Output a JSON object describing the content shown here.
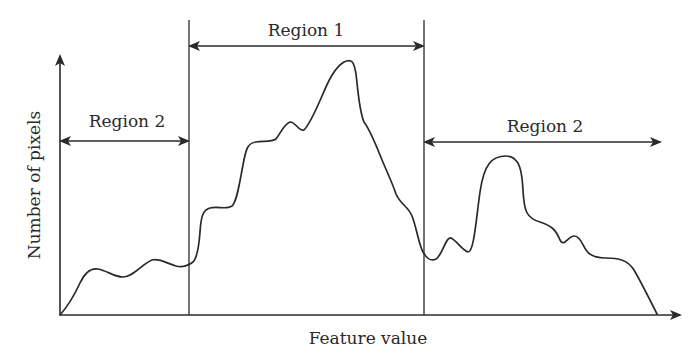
{
  "figure": {
    "type": "histogram-diagram",
    "x_axis_label": "Feature value",
    "y_axis_label": "Number of pixels",
    "regions": [
      {
        "id": "left",
        "label": "Region 2",
        "x_start": 60,
        "x_end": 189
      },
      {
        "id": "center",
        "label": "Region 1",
        "x_start": 189,
        "x_end": 424
      },
      {
        "id": "right",
        "label": "Region 2",
        "x_start": 424,
        "x_end": 660
      }
    ],
    "thresholds": [
      189,
      424
    ],
    "colors": {
      "line": "#2a2a2a",
      "background": "#ffffff"
    }
  }
}
